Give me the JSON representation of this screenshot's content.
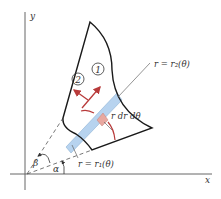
{
  "diagram": {
    "axes": {
      "x_label": "x",
      "y_label": "y"
    },
    "labels": {
      "outer_curve": "r = r₂(θ)",
      "inner_curve": "r = r₁(θ)",
      "element": "r dr dθ",
      "alpha": "α",
      "beta": "β",
      "step1": "1",
      "step2": "2"
    },
    "colors": {
      "outline": "#1a1a1a",
      "strip": "#b7d3ef",
      "element": "#e8a8a0",
      "arrow": "#b83a3a",
      "axes": "#555555",
      "dashed": "#555555"
    }
  }
}
